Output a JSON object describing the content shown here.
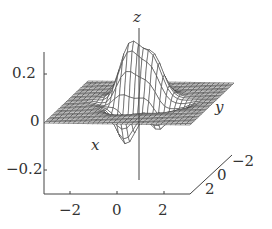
{
  "chart_data": {
    "type": "surface",
    "title": "",
    "xlabel": "x",
    "ylabel": "y",
    "zlabel": "z",
    "x_range": [
      -3,
      3
    ],
    "y_range": [
      -3,
      3
    ],
    "z_range": [
      -0.3,
      0.3
    ],
    "z_ticks": [
      "0.2",
      "0",
      "−0.2"
    ],
    "x_ticks": [
      "−2",
      "0",
      "2"
    ],
    "y_ticks": [
      "2",
      "0",
      "−2"
    ],
    "grid": false,
    "style": "mesh wireframe, grayscale"
  },
  "labels": {
    "z_axis": "z",
    "x_axis": "x",
    "y_axis": "y",
    "ztick_top": "0.2",
    "ztick_mid": "0",
    "ztick_bot": "−0.2",
    "xtick_1": "−2",
    "xtick_2": "0",
    "xtick_3": "2",
    "ytick_1": "2",
    "ytick_2": "0",
    "ytick_3": "−2"
  }
}
